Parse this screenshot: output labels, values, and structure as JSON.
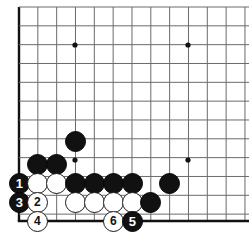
{
  "diagram": {
    "kind": "go-board-diagram",
    "board": {
      "grid_spacing": 18.83,
      "origin_x": 19,
      "origin_y": 7,
      "columns": 13,
      "rows": 13,
      "edges": [
        "left",
        "bottom"
      ],
      "line_color": "#6b6b6b",
      "edge_color": "#111111",
      "background_color": "#ffffff"
    },
    "star_points": [
      {
        "x": 75,
        "y": 45
      },
      {
        "x": 188,
        "y": 45
      },
      {
        "x": 75,
        "y": 160
      },
      {
        "x": 188,
        "y": 160
      }
    ],
    "stones": [
      {
        "id": "b-a",
        "color": "black",
        "x": 75,
        "y": 141,
        "label": ""
      },
      {
        "id": "b-b",
        "color": "black",
        "x": 37,
        "y": 164,
        "label": ""
      },
      {
        "id": "b-c",
        "color": "black",
        "x": 56,
        "y": 164,
        "label": ""
      },
      {
        "id": "b-1",
        "color": "black",
        "x": 19,
        "y": 183,
        "label": "1"
      },
      {
        "id": "w-a",
        "color": "white",
        "x": 37,
        "y": 183,
        "label": ""
      },
      {
        "id": "w-b",
        "color": "white",
        "x": 56,
        "y": 183,
        "label": ""
      },
      {
        "id": "b-d",
        "color": "black",
        "x": 75,
        "y": 183,
        "label": ""
      },
      {
        "id": "b-e",
        "color": "black",
        "x": 94,
        "y": 183,
        "label": ""
      },
      {
        "id": "b-f",
        "color": "black",
        "x": 113,
        "y": 183,
        "label": ""
      },
      {
        "id": "b-g",
        "color": "black",
        "x": 132,
        "y": 183,
        "label": ""
      },
      {
        "id": "b-h",
        "color": "black",
        "x": 169,
        "y": 183,
        "label": ""
      },
      {
        "id": "b-3",
        "color": "black",
        "x": 19,
        "y": 202,
        "label": "3"
      },
      {
        "id": "w-2",
        "color": "white",
        "x": 37,
        "y": 202,
        "label": "2"
      },
      {
        "id": "w-c",
        "color": "white",
        "x": 75,
        "y": 202,
        "label": ""
      },
      {
        "id": "w-d",
        "color": "white",
        "x": 94,
        "y": 202,
        "label": ""
      },
      {
        "id": "w-e",
        "color": "white",
        "x": 113,
        "y": 202,
        "label": ""
      },
      {
        "id": "w-f",
        "color": "white",
        "x": 132,
        "y": 202,
        "label": ""
      },
      {
        "id": "b-i",
        "color": "black",
        "x": 150,
        "y": 202,
        "label": ""
      },
      {
        "id": "w-4",
        "color": "white",
        "x": 37,
        "y": 221,
        "label": "4"
      },
      {
        "id": "w-6",
        "color": "white",
        "x": 113,
        "y": 221,
        "label": "6"
      },
      {
        "id": "b-5",
        "color": "black",
        "x": 132,
        "y": 221,
        "label": "5"
      }
    ],
    "stone_diameter": 21,
    "move_labels": [
      "1",
      "2",
      "3",
      "4",
      "5",
      "6"
    ]
  }
}
